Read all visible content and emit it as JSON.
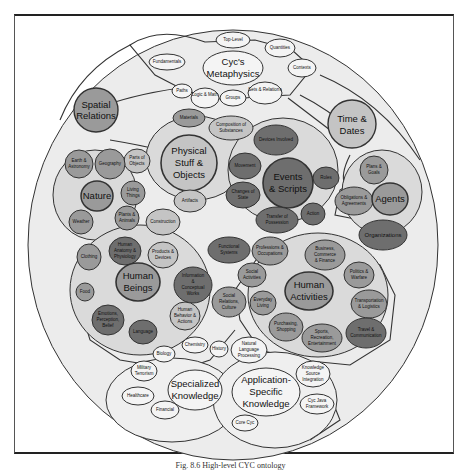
{
  "caption": "Fig. 8.6 High-level CYC ontology",
  "colors": {
    "outer_fill": "#ececec",
    "white_node": "#f4f4f4",
    "light_node": "#c4c4c4",
    "mid_node": "#9a9a9a",
    "dark_node": "#6e6e6e",
    "group_fill": "#dadada",
    "stroke": "#333333"
  },
  "groups": {
    "metaphysics": {
      "label": "Cyc's Metaphysics",
      "nodes": [
        "Top-Level",
        "Quantities",
        "Contexts",
        "Fundamentals",
        "Paths",
        "Logic & Math",
        "Groups",
        "Sets & Relations"
      ]
    },
    "spatial": {
      "label": "Spatial Relations"
    },
    "time": {
      "label": "Time & Dates"
    },
    "physical": {
      "label": "Physical Stuff & Objects",
      "nodes": [
        "Materials",
        "Composition of Substances",
        "Parts of Objects",
        "Artifacts",
        "Construction"
      ]
    },
    "events": {
      "label": "Events & Scripts",
      "nodes": [
        "Movement",
        "Changes of State",
        "Transfer of Possession",
        "Roles",
        "Action",
        "Devices Involved"
      ]
    },
    "nature": {
      "label": "Nature",
      "nodes": [
        "Earth & Astronomy",
        "Geography",
        "Living Things",
        "Plants & Animals",
        "Weather"
      ]
    },
    "agents": {
      "label": "Agents",
      "nodes": [
        "Plans & Goals",
        "Obligations & Agreements",
        "Organizations"
      ]
    },
    "human_beings": {
      "label": "Human Beings",
      "nodes": [
        "Human Anatomy & Physiology",
        "Products & Devices",
        "Clothing",
        "Food",
        "Information & Conceptual Works",
        "Emotions, Perception, Belief",
        "Language",
        "Human Behavior & Actions"
      ]
    },
    "human_activities": {
      "label": "Human Activities",
      "nodes": [
        "Functional Systems",
        "Professions & Occupations",
        "Business, Commerce & Finance",
        "Social Activities",
        "Politics & Warfare",
        "Everyday Living",
        "Social Relations, Culture",
        "Transportation & Logistics",
        "Purchasing, Shopping",
        "Sports, Recreation, Entertainment",
        "Travel & Communication"
      ]
    },
    "specialized": {
      "label": "Specialized Knowledge",
      "nodes": [
        "Biology",
        "Chemistry",
        "History",
        "Military Terrorism",
        "Healthcare",
        "Financial"
      ]
    },
    "application": {
      "label": "Application-Specific Knowledge",
      "nodes": [
        "Natural Language Processing",
        "Knowledge Source Integration",
        "Cyc Java Framework",
        "Core Cyc"
      ]
    }
  },
  "labels": {
    "top_level": "Top-Level",
    "quantities": "Quantities",
    "contexts": "Contexts",
    "fundamentals": "Fundamentals",
    "paths": "Paths",
    "logic_math": "Logic & Math",
    "groups_n": "Groups",
    "sets_relations": "Sets & Relations",
    "metaphysics_1": "Cyc's",
    "metaphysics_2": "Metaphysics",
    "spatial_1": "Spatial",
    "spatial_2": "Relations",
    "time_1": "Time &",
    "time_2": "Dates",
    "materials": "Materials",
    "composition_1": "Composition of",
    "composition_2": "Substances",
    "parts_1": "Parts of",
    "parts_2": "Objects",
    "physical_1": "Physical",
    "physical_2": "Stuff &",
    "physical_3": "Objects",
    "artifacts": "Artifacts",
    "construction": "Construction",
    "devices_involved": "Devices Involved",
    "movement": "Movement",
    "events_1": "Events",
    "events_2": "& Scripts",
    "changes_1": "Changes of",
    "changes_2": "State",
    "transfer_1": "Transfer of",
    "transfer_2": "Possession",
    "roles": "Roles",
    "action": "Action",
    "earth_1": "Earth &",
    "earth_2": "Astronomy",
    "geography": "Geography",
    "nature": "Nature",
    "living_1": "Living",
    "living_2": "Things",
    "plants_1": "Plants &",
    "plants_2": "Animals",
    "weather": "Weather",
    "plans_1": "Plans &",
    "plans_2": "Goals",
    "obligations_1": "Obligations &",
    "obligations_2": "Agreements",
    "agents": "Agents",
    "organizations": "Organizations",
    "anatomy_1": "Human",
    "anatomy_2": "Anatomy &",
    "anatomy_3": "Physiology",
    "products_1": "Products &",
    "products_2": "Devices",
    "clothing": "Clothing",
    "food": "Food",
    "human_1": "Human",
    "human_2": "Beings",
    "info_1": "Information",
    "info_2": "&",
    "info_3": "Conceptual",
    "info_4": "Works",
    "emotions_1": "Emotions,",
    "emotions_2": "Perception,",
    "emotions_3": "Belief",
    "language": "Language",
    "behavior_1": "Human",
    "behavior_2": "Behavior &",
    "behavior_3": "Actions",
    "functional_1": "Functional",
    "functional_2": "Systems",
    "professions_1": "Professions &",
    "professions_2": "Occupations",
    "business_1": "Business,",
    "business_2": "Commerce",
    "business_3": "& Finance",
    "social_act_1": "Social",
    "social_act_2": "Activities",
    "activities_1": "Human",
    "activities_2": "Activities",
    "politics_1": "Politics &",
    "politics_2": "Warfare",
    "everyday_1": "Everyday",
    "everyday_2": "Living",
    "social_rel_1": "Social",
    "social_rel_2": "Relations,",
    "social_rel_3": "Culture",
    "transport_1": "Transportation",
    "transport_2": "& Logistics",
    "purchasing_1": "Purchasing,",
    "purchasing_2": "Shopping",
    "sports_1": "Sports,",
    "sports_2": "Recreation,",
    "sports_3": "Entertainment",
    "travel_1": "Travel &",
    "travel_2": "Communication",
    "chemistry": "Chemistry",
    "biology": "Biology",
    "history": "History",
    "military_1": "Military",
    "military_2": "Terrorism",
    "specialized_1": "Specialized",
    "specialized_2": "Knowledge",
    "healthcare": "Healthcare",
    "financial": "Financial",
    "nlp_1": "Natural",
    "nlp_2": "Language",
    "nlp_3": "Processing",
    "app_1": "Application-",
    "app_2": "Specific",
    "app_3": "Knowledge",
    "ksi_1": "Knowledge",
    "ksi_2": "Source",
    "ksi_3": "Integration",
    "java_1": "Cyc Java",
    "java_2": "Framework",
    "core_cyc": "Core Cyc"
  }
}
